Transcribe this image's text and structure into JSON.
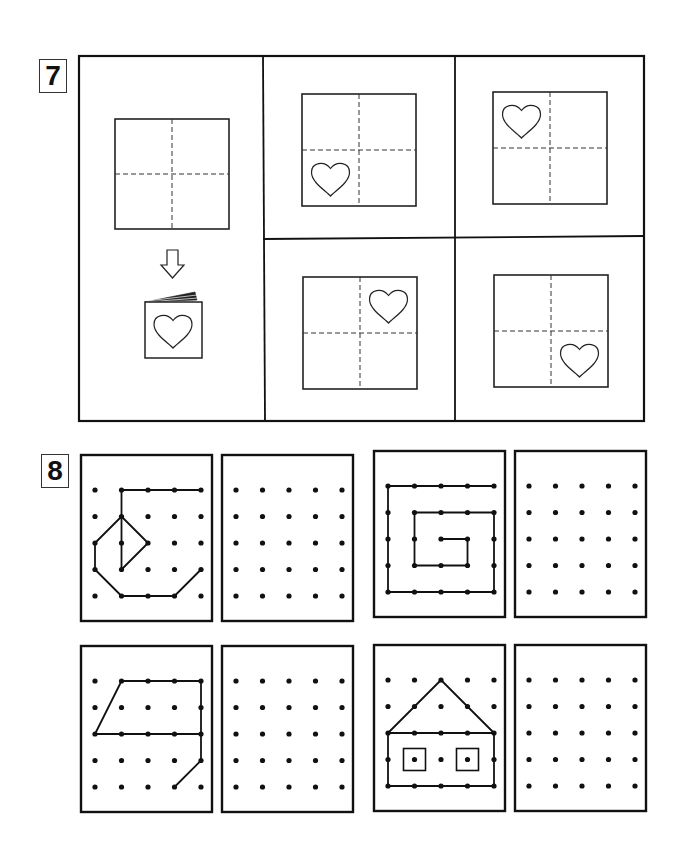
{
  "exercise7": {
    "number": "7",
    "instruction_visual": "fold-paper-into-quarters-then-cut-heart",
    "folded_booklet_icon": "booklet-with-heart-icon",
    "arrow_icon": "down-arrow-icon",
    "options": [
      {
        "id": "A",
        "heart_quadrant": "bottom-left"
      },
      {
        "id": "B",
        "heart_quadrant": "top-left"
      },
      {
        "id": "C",
        "heart_quadrant": "top-right"
      },
      {
        "id": "D",
        "heart_quadrant": "bottom-right"
      }
    ]
  },
  "exercise8": {
    "number": "8",
    "grid_size": [
      5,
      5
    ],
    "pairs": [
      {
        "pattern": [
          [
            [
              1,
              0
            ],
            [
              4,
              0
            ]
          ],
          [
            [
              1,
              0
            ],
            [
              1,
              3
            ]
          ],
          [
            [
              1,
              1
            ],
            [
              2,
              2
            ]
          ],
          [
            [
              2,
              2
            ],
            [
              1,
              3
            ]
          ],
          [
            [
              1,
              1
            ],
            [
              0,
              2
            ]
          ],
          [
            [
              0,
              2
            ],
            [
              0,
              3
            ]
          ],
          [
            [
              0,
              3
            ],
            [
              1,
              4
            ]
          ],
          [
            [
              1,
              4
            ],
            [
              3,
              4
            ]
          ],
          [
            [
              3,
              4
            ],
            [
              4,
              3
            ]
          ]
        ],
        "squares": []
      },
      {
        "pattern": [
          [
            [
              4,
              0
            ],
            [
              0,
              0
            ]
          ],
          [
            [
              0,
              0
            ],
            [
              0,
              4
            ]
          ],
          [
            [
              0,
              4
            ],
            [
              4,
              4
            ]
          ],
          [
            [
              4,
              4
            ],
            [
              4,
              1
            ]
          ],
          [
            [
              4,
              1
            ],
            [
              1,
              1
            ]
          ],
          [
            [
              1,
              1
            ],
            [
              1,
              3
            ]
          ],
          [
            [
              1,
              3
            ],
            [
              3,
              3
            ]
          ],
          [
            [
              3,
              3
            ],
            [
              3,
              2
            ]
          ],
          [
            [
              3,
              2
            ],
            [
              2,
              2
            ]
          ]
        ],
        "squares": []
      },
      {
        "pattern": [
          [
            [
              1,
              0
            ],
            [
              4,
              0
            ]
          ],
          [
            [
              4,
              0
            ],
            [
              4,
              3
            ]
          ],
          [
            [
              4,
              3
            ],
            [
              3,
              4
            ]
          ],
          [
            [
              1,
              0
            ],
            [
              0,
              2
            ]
          ],
          [
            [
              0,
              2
            ],
            [
              4,
              2
            ]
          ]
        ],
        "squares": []
      },
      {
        "pattern": [
          [
            [
              0,
              2
            ],
            [
              2,
              0
            ]
          ],
          [
            [
              2,
              0
            ],
            [
              4,
              2
            ]
          ],
          [
            [
              0,
              2
            ],
            [
              4,
              2
            ]
          ],
          [
            [
              4,
              2
            ],
            [
              4,
              4
            ]
          ],
          [
            [
              4,
              4
            ],
            [
              0,
              4
            ]
          ],
          [
            [
              0,
              4
            ],
            [
              0,
              2
            ]
          ]
        ],
        "squares": [
          [
            1,
            3
          ],
          [
            3,
            3
          ]
        ]
      }
    ]
  }
}
